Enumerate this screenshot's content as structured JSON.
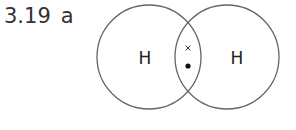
{
  "question": {
    "number": "3.19",
    "part": "a"
  },
  "diagram": {
    "atoms": [
      {
        "symbol": "H",
        "cx": 149,
        "cy": 57,
        "r": 52
      },
      {
        "symbol": "H",
        "cx": 227,
        "cy": 57,
        "r": 52
      }
    ],
    "shared_electrons": [
      {
        "type": "cross",
        "symbol": "×",
        "x": 188,
        "y": 48
      },
      {
        "type": "dot",
        "symbol": "•",
        "x": 188,
        "y": 66
      }
    ],
    "colors": {
      "outline": "#666666",
      "text": "#222222"
    }
  }
}
